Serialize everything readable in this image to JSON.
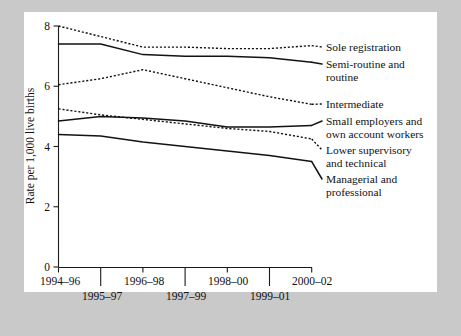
{
  "chart_data": {
    "type": "line",
    "title": "",
    "xlabel": "",
    "ylabel": "Rate per 1,000 live births",
    "ylim": [
      0,
      8
    ],
    "yticks": [
      0,
      2,
      4,
      6,
      8
    ],
    "ytick_labels": [
      "0",
      "2",
      "4",
      "6",
      "8"
    ],
    "grid": false,
    "legend_position": "right-inline",
    "categories": [
      "1994–96",
      "1995–97",
      "1996–98",
      "1997–99",
      "1998–00",
      "1999–01",
      "2000–02"
    ],
    "xtick_labels_top": [
      "1994–96",
      "1996–98",
      "1998–00",
      "2000–02"
    ],
    "xtick_labels_bottom": [
      "1995–97",
      "1997–99",
      "1999–01"
    ],
    "series": [
      {
        "name": "Sole registration",
        "style": "dotted",
        "values": [
          8.0,
          7.65,
          7.3,
          7.3,
          7.25,
          7.25,
          7.35
        ]
      },
      {
        "name": "Semi-routine and routine",
        "style": "solid",
        "values": [
          7.4,
          7.4,
          7.05,
          7.0,
          7.0,
          6.95,
          6.8
        ]
      },
      {
        "name": "Intermediate",
        "style": "dotted",
        "values": [
          6.05,
          6.25,
          6.55,
          6.25,
          5.95,
          5.65,
          5.4
        ]
      },
      {
        "name": "Small employers and own account workers",
        "style": "solid",
        "values": [
          4.85,
          5.0,
          4.95,
          4.85,
          4.65,
          4.65,
          4.7
        ]
      },
      {
        "name": "Lower supervisory and technical",
        "style": "dotted",
        "values": [
          5.25,
          5.05,
          4.9,
          4.75,
          4.6,
          4.5,
          4.25
        ]
      },
      {
        "name": "Managerial and professional",
        "style": "solid",
        "values": [
          4.4,
          4.35,
          4.15,
          4.0,
          3.85,
          3.7,
          3.5
        ]
      }
    ],
    "legend_entries": [
      {
        "label_line1": "Sole registration",
        "label_line2": ""
      },
      {
        "label_line1": "Semi-routine and",
        "label_line2": "routine"
      },
      {
        "label_line1": "Intermediate",
        "label_line2": ""
      },
      {
        "label_line1": "Small employers and",
        "label_line2": "own account workers"
      },
      {
        "label_line1": "Lower supervisory",
        "label_line2": "and technical"
      },
      {
        "label_line1": "Managerial and",
        "label_line2": "professional"
      }
    ]
  }
}
